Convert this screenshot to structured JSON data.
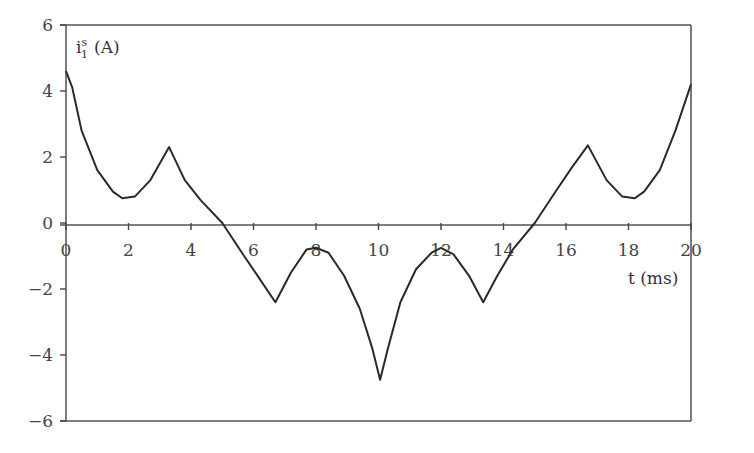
{
  "chart_data": {
    "type": "line",
    "title": "",
    "xlabel": "t (ms)",
    "ylabel": "i1s (A)",
    "ylabel_parts": {
      "base": "i",
      "sup": "s",
      "sub": "1",
      "unit": "(A)"
    },
    "xlim": [
      0,
      20
    ],
    "ylim": [
      -6,
      6
    ],
    "xticks": [
      "0",
      "2",
      "4",
      "6",
      "8",
      "10",
      "12",
      "14",
      "16",
      "18",
      "20"
    ],
    "yticks": [
      "6",
      "4",
      "2",
      "0",
      "−2",
      "−4",
      "−6"
    ],
    "grid": false,
    "legend": null,
    "series": [
      {
        "name": "i1s",
        "x": [
          0,
          0.2,
          0.5,
          1.0,
          1.5,
          1.8,
          2.2,
          2.7,
          3.3,
          3.8,
          4.3,
          5.0,
          5.7,
          6.2,
          6.7,
          7.2,
          7.7,
          8.0,
          8.4,
          8.9,
          9.4,
          9.8,
          10.05,
          10.3,
          10.7,
          11.2,
          11.7,
          12.0,
          12.4,
          12.9,
          13.35,
          13.8,
          14.3,
          15.0,
          15.7,
          16.2,
          16.7,
          17.3,
          17.8,
          18.2,
          18.5,
          19.0,
          19.5,
          20.0
        ],
        "y": [
          4.6,
          4.1,
          2.8,
          1.6,
          0.95,
          0.75,
          0.8,
          1.3,
          2.3,
          1.3,
          0.7,
          0.0,
          -1.0,
          -1.7,
          -2.4,
          -1.5,
          -0.8,
          -0.75,
          -0.9,
          -1.6,
          -2.6,
          -3.8,
          -4.75,
          -3.8,
          -2.4,
          -1.4,
          -0.9,
          -0.75,
          -0.95,
          -1.6,
          -2.4,
          -1.6,
          -0.8,
          0.0,
          1.0,
          1.7,
          2.35,
          1.3,
          0.8,
          0.75,
          0.95,
          1.6,
          2.8,
          4.2
        ]
      }
    ]
  }
}
